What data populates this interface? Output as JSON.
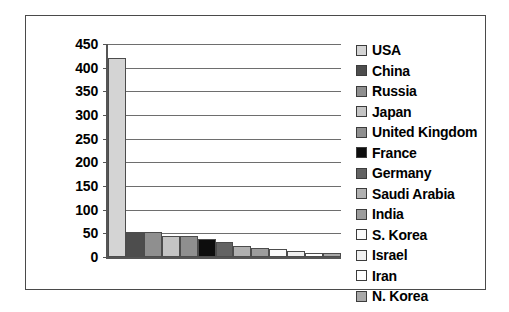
{
  "chart_data": {
    "type": "bar",
    "title": "",
    "xlabel": "",
    "ylabel": "",
    "ylim": [
      0,
      450
    ],
    "ytick_step": 50,
    "grid": true,
    "legend_position": "right",
    "categories": [
      "USA",
      "China",
      "Russia",
      "Japan",
      "United Kingdom",
      "France",
      "Germany",
      "Saudi Arabia",
      "India",
      "S. Korea",
      "Israel",
      "Iran",
      "N. Korea"
    ],
    "values": [
      420,
      52,
      53,
      44,
      44,
      38,
      31,
      24,
      19,
      17,
      13,
      9,
      8
    ],
    "ytick_labels": [
      "450",
      "400",
      "350",
      "300",
      "250",
      "200",
      "150",
      "100",
      "50",
      "0"
    ],
    "series": [
      {
        "name": "Military Spending",
        "values": [
          420,
          52,
          53,
          44,
          44,
          38,
          31,
          24,
          19,
          17,
          13,
          9,
          8
        ]
      }
    ],
    "bar_colors": [
      "#d4d4d4",
      "#4d4d4d",
      "#8f8f8f",
      "#c4c4c4",
      "#8f8f8f",
      "#0d0d0d",
      "#636363",
      "#b0b0b0",
      "#9c9c9c",
      "#fbfbfb",
      "#f0f0f0",
      "#ffffff",
      "#a8a8a8"
    ]
  },
  "legend": {
    "items": [
      {
        "label": "USA",
        "color": "#d4d4d4"
      },
      {
        "label": "China",
        "color": "#4d4d4d"
      },
      {
        "label": "Russia",
        "color": "#8f8f8f"
      },
      {
        "label": "Japan",
        "color": "#c4c4c4"
      },
      {
        "label": "United Kingdom",
        "color": "#8f8f8f"
      },
      {
        "label": "France",
        "color": "#0d0d0d"
      },
      {
        "label": "Germany",
        "color": "#636363"
      },
      {
        "label": "Saudi Arabia",
        "color": "#b0b0b0"
      },
      {
        "label": "India",
        "color": "#9c9c9c"
      },
      {
        "label": "S. Korea",
        "color": "#fbfbfb"
      },
      {
        "label": "Israel",
        "color": "#f0f0f0"
      },
      {
        "label": "Iran",
        "color": "#ffffff"
      },
      {
        "label": "N. Korea",
        "color": "#a8a8a8"
      }
    ]
  }
}
